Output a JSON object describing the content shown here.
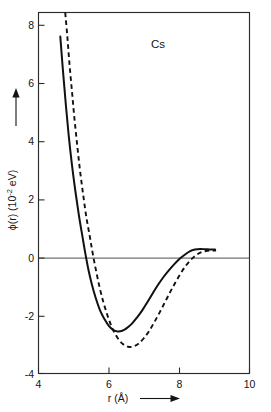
{
  "figure": {
    "series_label": "Cs",
    "background": "#ffffff",
    "ink_color": "#111111"
  },
  "axes": {
    "x": {
      "title_text": "r (",
      "title_unit": "Å",
      "title_close": ")",
      "ticks": [
        "4",
        "6",
        "8",
        "10"
      ],
      "range": [
        4,
        10
      ],
      "arrow": "right-arrow-icon"
    },
    "y": {
      "title_phi": "ϕ(r) (10",
      "title_exp": "-2",
      "title_tail": " eV)",
      "ticks": [
        "8",
        "6",
        "4",
        "2",
        "0",
        "-2",
        "-4"
      ],
      "range": [
        -4,
        8
      ],
      "arrow": "up-arrow-icon"
    }
  },
  "chart_data": {
    "type": "line",
    "title": "Cs",
    "xlabel": "r (Å)",
    "ylabel": "ϕ(r) (10⁻² eV)",
    "xlim": [
      4,
      10
    ],
    "ylim": [
      -4,
      8
    ],
    "grid": false,
    "legend_position": "none",
    "annotations": [
      {
        "text": "Cs",
        "x": 7.1,
        "y": 7.2
      }
    ],
    "series": [
      {
        "name": "solid curve",
        "style": "solid",
        "color": "#111111",
        "points": [
          [
            4.62,
            7.2
          ],
          [
            4.7,
            6.0
          ],
          [
            4.78,
            4.9
          ],
          [
            4.86,
            3.9
          ],
          [
            4.95,
            2.95
          ],
          [
            5.05,
            2.05
          ],
          [
            5.15,
            1.25
          ],
          [
            5.25,
            0.55
          ],
          [
            5.33,
            0.0
          ],
          [
            5.42,
            -0.55
          ],
          [
            5.52,
            -1.05
          ],
          [
            5.63,
            -1.5
          ],
          [
            5.75,
            -1.9
          ],
          [
            5.88,
            -2.2
          ],
          [
            6.0,
            -2.42
          ],
          [
            6.12,
            -2.55
          ],
          [
            6.25,
            -2.6
          ],
          [
            6.38,
            -2.58
          ],
          [
            6.5,
            -2.5
          ],
          [
            6.65,
            -2.35
          ],
          [
            6.8,
            -2.14
          ],
          [
            6.95,
            -1.9
          ],
          [
            7.1,
            -1.62
          ],
          [
            7.25,
            -1.33
          ],
          [
            7.4,
            -1.05
          ],
          [
            7.55,
            -0.8
          ],
          [
            7.7,
            -0.58
          ],
          [
            7.85,
            -0.38
          ],
          [
            8.0,
            -0.2
          ],
          [
            8.15,
            -0.06
          ],
          [
            8.3,
            0.06
          ],
          [
            8.45,
            0.12
          ],
          [
            8.6,
            0.14
          ],
          [
            8.75,
            0.13
          ],
          [
            8.9,
            0.12
          ],
          [
            9.02,
            0.12
          ]
        ]
      },
      {
        "name": "dashed curve",
        "style": "dashed",
        "color": "#111111",
        "points": [
          [
            4.76,
            8.0
          ],
          [
            4.82,
            7.2
          ],
          [
            4.88,
            6.3
          ],
          [
            4.95,
            5.4
          ],
          [
            5.02,
            4.5
          ],
          [
            5.1,
            3.6
          ],
          [
            5.18,
            2.75
          ],
          [
            5.27,
            1.95
          ],
          [
            5.36,
            1.2
          ],
          [
            5.46,
            0.55
          ],
          [
            5.54,
            0.0
          ],
          [
            5.64,
            -0.6
          ],
          [
            5.74,
            -1.15
          ],
          [
            5.85,
            -1.65
          ],
          [
            5.97,
            -2.1
          ],
          [
            6.1,
            -2.5
          ],
          [
            6.25,
            -2.82
          ],
          [
            6.4,
            -3.02
          ],
          [
            6.55,
            -3.11
          ],
          [
            6.7,
            -3.1
          ],
          [
            6.85,
            -3.0
          ],
          [
            7.0,
            -2.82
          ],
          [
            7.15,
            -2.58
          ],
          [
            7.3,
            -2.28
          ],
          [
            7.45,
            -1.96
          ],
          [
            7.6,
            -1.62
          ],
          [
            7.75,
            -1.28
          ],
          [
            7.9,
            -0.96
          ],
          [
            8.05,
            -0.66
          ],
          [
            8.2,
            -0.4
          ],
          [
            8.35,
            -0.2
          ],
          [
            8.5,
            -0.05
          ],
          [
            8.65,
            0.04
          ],
          [
            8.8,
            0.08
          ],
          [
            8.95,
            0.09
          ],
          [
            9.05,
            0.09
          ]
        ]
      }
    ]
  }
}
